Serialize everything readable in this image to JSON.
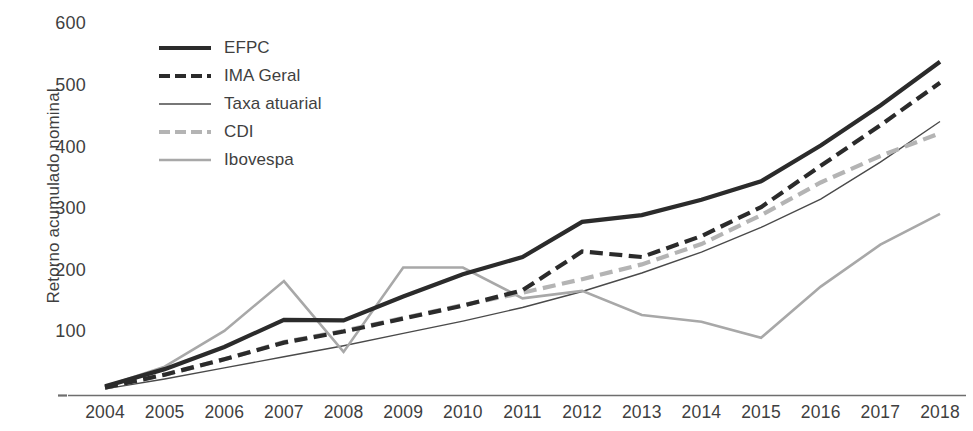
{
  "axes": {
    "ylabel": "Retorno acumulado nominal",
    "yticks": [
      "100",
      "200",
      "300",
      "400",
      "500",
      "600"
    ],
    "xticks": [
      "2004",
      "2005",
      "2006",
      "2007",
      "2008",
      "2009",
      "2010",
      "2011",
      "2012",
      "2013",
      "2014",
      "2015",
      "2016",
      "2017",
      "2018"
    ]
  },
  "legend": {
    "items": [
      {
        "label": "EFPC",
        "style": "thick-solid",
        "color": "#2b2b2b"
      },
      {
        "label": "IMA Geral",
        "style": "thick-dashed",
        "color": "#2b2b2b"
      },
      {
        "label": "Taxa atuarial",
        "style": "thin-solid",
        "color": "#4a4a4a"
      },
      {
        "label": "CDI",
        "style": "thick-dashed",
        "color": "#b4b4b4"
      },
      {
        "label": "Ibovespa",
        "style": "medium-solid",
        "color": "#a8a8a8"
      }
    ]
  },
  "chart_data": {
    "type": "line",
    "title": "",
    "xlabel": "",
    "ylabel": "Retorno acumulado nominal",
    "x": [
      2004,
      2005,
      2006,
      2007,
      2008,
      2009,
      2010,
      2011,
      2012,
      2013,
      2014,
      2015,
      2016,
      2017,
      2018
    ],
    "categories": [
      "2004",
      "2005",
      "2006",
      "2007",
      "2008",
      "2009",
      "2010",
      "2011",
      "2012",
      "2013",
      "2014",
      "2015",
      "2016",
      "2017",
      "2018"
    ],
    "ylim": [
      0,
      620
    ],
    "yticks": [
      100,
      200,
      300,
      400,
      500,
      600
    ],
    "grid": false,
    "legend_position": "upper-left",
    "series": [
      {
        "name": "EFPC",
        "color": "#2b2b2b",
        "style": "solid",
        "width": 4.2,
        "values": [
          14,
          42,
          78,
          122,
          121,
          160,
          196,
          224,
          281,
          292,
          317,
          347,
          405,
          470,
          541
        ]
      },
      {
        "name": "IMA Geral",
        "color": "#2b2b2b",
        "style": "dashed",
        "width": 4.2,
        "values": [
          12,
          33,
          58,
          85,
          103,
          124,
          145,
          170,
          233,
          224,
          258,
          305,
          372,
          438,
          507
        ]
      },
      {
        "name": "Taxa atuarial",
        "color": "#4a4a4a",
        "style": "solid",
        "width": 1.4,
        "values": [
          10,
          26,
          44,
          62,
          80,
          100,
          120,
          142,
          168,
          198,
          232,
          272,
          318,
          378,
          444
        ]
      },
      {
        "name": "CDI",
        "color": "#b4b4b4",
        "style": "dashed",
        "width": 4.2,
        "values": [
          12,
          33,
          58,
          86,
          104,
          125,
          146,
          166,
          188,
          212,
          245,
          292,
          345,
          388,
          425
        ]
      },
      {
        "name": "Ibovespa",
        "color": "#a8a8a8",
        "style": "solid",
        "width": 2.6,
        "values": [
          14,
          46,
          104,
          185,
          70,
          207,
          207,
          157,
          169,
          130,
          119,
          93,
          176,
          244,
          294
        ]
      }
    ]
  }
}
